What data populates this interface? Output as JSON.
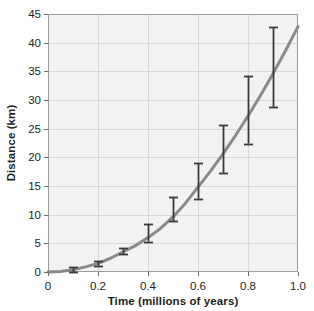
{
  "chart_data": {
    "type": "line",
    "title": "",
    "xlabel": "Time (millions of years)",
    "ylabel": "Distance (km)",
    "xlim": [
      0,
      1.0
    ],
    "ylim": [
      0,
      45
    ],
    "xticks": [
      "0",
      "0.2",
      "0.4",
      "0.6",
      "0.8",
      "1.0"
    ],
    "xtick_values": [
      0,
      0.2,
      0.4,
      0.6,
      0.8,
      1.0
    ],
    "yticks": [
      "0",
      "5",
      "10",
      "15",
      "20",
      "25",
      "30",
      "35",
      "40",
      "45"
    ],
    "ytick_values": [
      0,
      5,
      10,
      15,
      20,
      25,
      30,
      35,
      40,
      45
    ],
    "grid": true,
    "legend": "none",
    "series": [
      {
        "name": "Distance",
        "kind": "fit-curve",
        "color": "#8a8a8a",
        "line_width": 3,
        "x": [
          0.0,
          0.05,
          0.1,
          0.15,
          0.2,
          0.25,
          0.3,
          0.35,
          0.4,
          0.45,
          0.5,
          0.55,
          0.6,
          0.65,
          0.7,
          0.75,
          0.8,
          0.85,
          0.9,
          0.95,
          1.0
        ],
        "y": [
          0.0,
          0.1,
          0.4,
          0.9,
          1.5,
          2.4,
          3.5,
          4.6,
          6.0,
          7.6,
          9.6,
          12.0,
          14.8,
          17.6,
          20.6,
          23.8,
          27.2,
          30.8,
          34.6,
          38.6,
          42.8
        ]
      },
      {
        "name": "Measurements",
        "kind": "errorbar",
        "color": "#3a3a3a",
        "x": [
          0.1,
          0.2,
          0.3,
          0.4,
          0.5,
          0.6,
          0.7,
          0.8,
          0.9
        ],
        "y": [
          0.4,
          1.5,
          3.6,
          6.6,
          11.0,
          15.8,
          21.4,
          28.2,
          35.6
        ],
        "y_low": [
          0.0,
          1.0,
          3.1,
          5.3,
          8.9,
          12.8,
          17.3,
          22.4,
          28.8
        ],
        "y_high": [
          0.8,
          1.9,
          4.1,
          8.4,
          13.1,
          19.0,
          25.6,
          34.1,
          42.7
        ]
      }
    ]
  },
  "axes": {
    "x_title": "Time (millions of years)",
    "y_title": "Distance (km)"
  }
}
